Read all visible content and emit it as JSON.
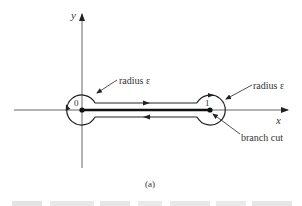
{
  "figure": {
    "type": "contour diagram (dogbone contour around branch cut)",
    "axes": {
      "x_label": "x",
      "y_label": "y"
    },
    "points": [
      {
        "label": "0",
        "role": "origin / branch point"
      },
      {
        "label": "1",
        "role": "branch point"
      }
    ],
    "annotations": {
      "left_radius": "radius ε",
      "right_radius": "radius ε",
      "branch_cut": "branch cut"
    },
    "subcaption": "(a)",
    "caption_line": "Figure ..."
  },
  "colors": {
    "ink": "#222222",
    "axis": "#555555",
    "background": "#ffffff"
  }
}
